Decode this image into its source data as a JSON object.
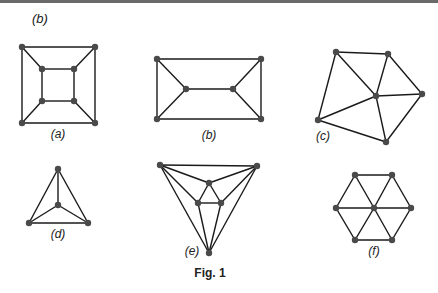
{
  "header_label": "(b)",
  "caption": "Fig. 1",
  "graphs": [
    {
      "id": "a",
      "label": "(a)",
      "label_pos": [
        58,
        138
      ],
      "nodes": [
        [
          22,
          47
        ],
        [
          95,
          47
        ],
        [
          22,
          123
        ],
        [
          95,
          123
        ],
        [
          42,
          69
        ],
        [
          74,
          69
        ],
        [
          42,
          101
        ],
        [
          74,
          101
        ]
      ],
      "edges": [
        [
          0,
          1
        ],
        [
          1,
          3
        ],
        [
          3,
          2
        ],
        [
          2,
          0
        ],
        [
          4,
          5
        ],
        [
          5,
          7
        ],
        [
          7,
          6
        ],
        [
          6,
          4
        ],
        [
          0,
          4
        ],
        [
          1,
          5
        ],
        [
          2,
          6
        ],
        [
          3,
          7
        ]
      ]
    },
    {
      "id": "b",
      "label": "(b)",
      "label_pos": [
        209,
        139
      ],
      "nodes": [
        [
          157,
          59
        ],
        [
          261,
          59
        ],
        [
          157,
          119
        ],
        [
          261,
          119
        ],
        [
          186,
          89
        ],
        [
          233,
          89
        ]
      ],
      "edges": [
        [
          0,
          1
        ],
        [
          1,
          3
        ],
        [
          3,
          2
        ],
        [
          2,
          0
        ],
        [
          0,
          4
        ],
        [
          2,
          4
        ],
        [
          4,
          5
        ],
        [
          5,
          1
        ],
        [
          5,
          3
        ]
      ]
    },
    {
      "id": "c",
      "label": "(c)",
      "label_pos": [
        323,
        140
      ],
      "nodes": [
        [
          336,
          52
        ],
        [
          388,
          54
        ],
        [
          422,
          94
        ],
        [
          386,
          142
        ],
        [
          318,
          120
        ],
        [
          376,
          96
        ]
      ],
      "edges": [
        [
          0,
          1
        ],
        [
          1,
          2
        ],
        [
          2,
          3
        ],
        [
          3,
          4
        ],
        [
          4,
          0
        ],
        [
          5,
          0
        ],
        [
          5,
          1
        ],
        [
          5,
          2
        ],
        [
          5,
          3
        ],
        [
          5,
          4
        ]
      ]
    },
    {
      "id": "d",
      "label": "(d)",
      "label_pos": [
        58,
        238
      ],
      "nodes": [
        [
          58,
          169
        ],
        [
          58,
          205
        ],
        [
          29,
          223
        ],
        [
          88,
          223
        ]
      ],
      "edges": [
        [
          0,
          1
        ],
        [
          0,
          2
        ],
        [
          0,
          3
        ],
        [
          1,
          2
        ],
        [
          1,
          3
        ],
        [
          2,
          3
        ]
      ]
    },
    {
      "id": "e",
      "label": "(e)",
      "label_pos": [
        192,
        255
      ],
      "nodes": [
        [
          160,
          165
        ],
        [
          257,
          166
        ],
        [
          209,
          253
        ],
        [
          209,
          183
        ],
        [
          198,
          203
        ],
        [
          221,
          203
        ]
      ],
      "edges": [
        [
          0,
          1
        ],
        [
          0,
          3
        ],
        [
          1,
          3
        ],
        [
          0,
          4
        ],
        [
          1,
          5
        ],
        [
          0,
          2
        ],
        [
          1,
          2
        ],
        [
          3,
          4
        ],
        [
          3,
          5
        ],
        [
          4,
          5
        ],
        [
          4,
          2
        ],
        [
          5,
          2
        ]
      ]
    },
    {
      "id": "f",
      "label": "(f)",
      "label_pos": [
        374,
        255
      ],
      "nodes": [
        [
          355,
          175
        ],
        [
          392,
          175
        ],
        [
          336,
          208
        ],
        [
          374,
          208
        ],
        [
          411,
          208
        ],
        [
          355,
          240
        ],
        [
          392,
          240
        ]
      ],
      "edges": [
        [
          0,
          1
        ],
        [
          1,
          4
        ],
        [
          4,
          6
        ],
        [
          6,
          5
        ],
        [
          5,
          2
        ],
        [
          2,
          0
        ],
        [
          3,
          0
        ],
        [
          3,
          1
        ],
        [
          3,
          2
        ],
        [
          3,
          4
        ],
        [
          3,
          5
        ],
        [
          3,
          6
        ]
      ]
    }
  ],
  "colors": {
    "edge": "#1a1a1a",
    "node": "#4a4a4a",
    "text": "#222222",
    "top_rule": "#6a6a6a"
  }
}
